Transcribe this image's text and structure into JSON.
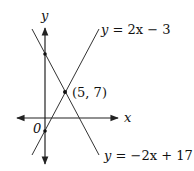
{
  "diagram": {
    "axes": {
      "x_label": "x",
      "y_label": "y",
      "origin_label": "0"
    },
    "lines": [
      {
        "equation": "y = 2x − 3",
        "label_y": "y",
        "label_rest": " = 2x − 3"
      },
      {
        "equation": "y = −2x + 17",
        "label_y": "y",
        "label_rest": " = −2x + 17"
      }
    ],
    "intersection": {
      "label": "(5, 7)",
      "x": 5,
      "y": 7
    },
    "points": [
      {
        "name": "y-intercept of y=-2x+17",
        "x": 0,
        "y": 17
      },
      {
        "name": "intersection",
        "x": 5,
        "y": 7
      },
      {
        "name": "y-intercept of y=2x-3",
        "x": 0,
        "y": -3
      }
    ],
    "colors": {
      "stroke": "#222222",
      "background": "#ffffff"
    }
  }
}
